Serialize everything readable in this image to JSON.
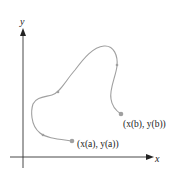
{
  "diagram": {
    "type": "parametric-curve",
    "axes": {
      "x_label": "x",
      "y_label": "y",
      "color": "#333333"
    },
    "curve": {
      "color": "#999999",
      "direction_markers": 4
    },
    "points": {
      "start": {
        "label": "(x(a), y(a))",
        "color": "#999999"
      },
      "end": {
        "label": "(x(b), y(b))",
        "color": "#999999"
      }
    }
  }
}
